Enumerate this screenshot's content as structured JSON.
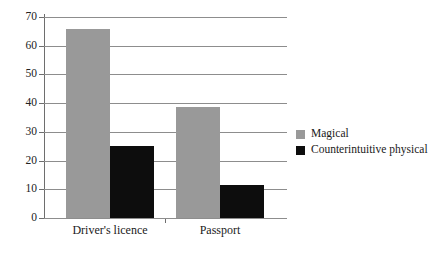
{
  "chart_data": {
    "type": "bar",
    "title": "",
    "subtitle": "",
    "xlabel": "",
    "ylabel": "",
    "categories": [
      "Driver's licence",
      "Passport"
    ],
    "series": [
      {
        "name": "Magical",
        "color": "#999999",
        "values": [
          66,
          38.5
        ]
      },
      {
        "name": "Counterintuitive physical",
        "color": "#0d0d0d",
        "values": [
          25,
          11.5
        ]
      }
    ],
    "ylim": [
      0,
      70
    ],
    "ytick_values": [
      0,
      10,
      20,
      30,
      40,
      50,
      60,
      70
    ],
    "ytick_labels": [
      "0",
      "10",
      "20",
      "30",
      "40",
      "50",
      "60",
      "70"
    ],
    "grid": true,
    "grid_axis": "y",
    "legend_position": "right"
  },
  "legend": {
    "entries": [
      {
        "label": "Magical",
        "swatch": "magical"
      },
      {
        "label": "Counterintuitive physical",
        "swatch": "counterintuitive"
      }
    ]
  },
  "axis": {
    "y_ticks": [
      {
        "label": "70",
        "value": 70
      },
      {
        "label": "60",
        "value": 60
      },
      {
        "label": "50",
        "value": 50
      },
      {
        "label": "40",
        "value": 40
      },
      {
        "label": "30",
        "value": 30
      },
      {
        "label": "20",
        "value": 20
      },
      {
        "label": "10",
        "value": 10
      },
      {
        "label": "0",
        "value": 0
      }
    ],
    "x_categories": [
      "Driver's licence",
      "Passport"
    ]
  }
}
